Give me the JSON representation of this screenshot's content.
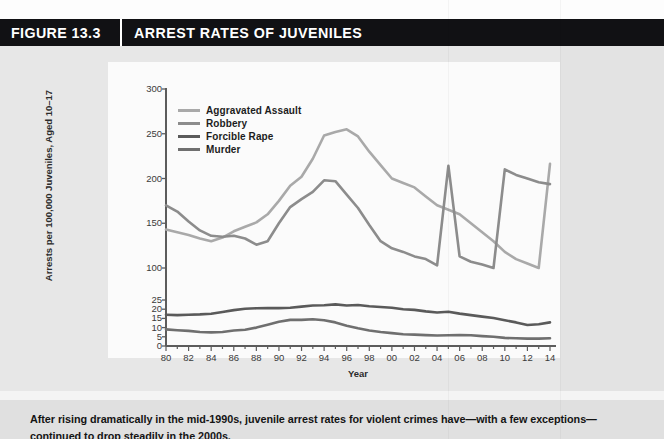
{
  "figure": {
    "number": "FIGURE 13.3",
    "title": "ARREST RATES OF JUVENILES"
  },
  "caption": {
    "line1": "After rising dramatically in the mid-1990s, juvenile arrest rates for violent crimes have—with a few exceptions—",
    "line2": "continued to drop steadily in the 2000s."
  },
  "colors": {
    "header_bg": "#111114",
    "header_text": "#ffffff",
    "body_bg": "#e7e7e7",
    "panel_bg": "#fbfbfb",
    "aggravated_assault": "#a9a9a9",
    "robbery": "#8c8c8c",
    "forcible_rape": "#5a5a5a",
    "murder": "#6f6f6f",
    "axis": "#5c5c5c"
  },
  "chart_data": {
    "type": "line",
    "title": "ARREST RATES OF JUVENILES",
    "xlabel": "Year",
    "ylabel": "Arrests per 100,000 Juveniles, Aged 10–17",
    "grid": false,
    "legend_position": "top-left",
    "axis_note": "Broken y-axis: lower segment 0-25 compressed, upper segment 100-300 linear",
    "x_tick_labels": [
      "80",
      "82",
      "84",
      "86",
      "88",
      "90",
      "92",
      "94",
      "96",
      "98",
      "00",
      "02",
      "04",
      "06",
      "08",
      "10",
      "12",
      "14"
    ],
    "x": [
      1980,
      1981,
      1982,
      1983,
      1984,
      1985,
      1986,
      1987,
      1988,
      1989,
      1990,
      1991,
      1992,
      1993,
      1994,
      1995,
      1996,
      1997,
      1998,
      1999,
      2000,
      2001,
      2002,
      2003,
      2004,
      2005,
      2006,
      2007,
      2008,
      2009,
      2010,
      2011,
      2012,
      2013,
      2014
    ],
    "y_ticks_upper": [
      100,
      150,
      200,
      250,
      300
    ],
    "y_ticks_lower": [
      0,
      5,
      10,
      15,
      20,
      25
    ],
    "ylim_upper": [
      100,
      300
    ],
    "ylim_lower": [
      0,
      25
    ],
    "series": [
      {
        "name": "Aggravated Assault",
        "color": "#a9a9a9",
        "values": [
          143,
          140,
          137,
          133,
          130,
          134,
          141,
          146,
          151,
          160,
          175,
          192,
          202,
          222,
          248,
          252,
          255,
          247,
          230,
          215,
          200,
          195,
          190,
          180,
          170,
          165,
          160,
          150,
          140,
          130,
          118,
          110,
          105,
          100,
          99
        ]
      },
      {
        "name": "Robbery",
        "color": "#8c8c8c",
        "values": [
          170,
          163,
          152,
          142,
          136,
          135,
          136,
          133,
          126,
          130,
          150,
          168,
          177,
          185,
          198,
          197,
          182,
          167,
          148,
          130,
          122,
          118,
          113,
          110,
          103,
          98,
          113,
          107,
          104,
          100,
          96,
          93,
          91,
          89,
          88
        ]
      },
      {
        "name": "Forcible Rape",
        "color": "#5a5a5a",
        "values": [
          17.0,
          16.8,
          17.0,
          17.2,
          17.5,
          18.5,
          19.5,
          20.2,
          20.5,
          20.6,
          20.6,
          20.8,
          21.4,
          22.0,
          22.2,
          22.6,
          22.0,
          22.3,
          21.6,
          21.2,
          20.8,
          20.0,
          19.6,
          18.8,
          18.2,
          18.6,
          17.6,
          16.8,
          16.0,
          15.2,
          14.0,
          12.8,
          11.4,
          11.8,
          12.8
        ]
      },
      {
        "name": "Murder",
        "color": "#6f6f6f",
        "values": [
          9.0,
          8.6,
          8.2,
          7.6,
          7.4,
          7.6,
          8.4,
          8.8,
          10.0,
          11.6,
          13.2,
          14.2,
          14.2,
          14.5,
          14.0,
          12.8,
          11.0,
          9.6,
          8.4,
          7.6,
          7.0,
          6.4,
          6.2,
          5.9,
          5.7,
          5.8,
          6.0,
          5.8,
          5.4,
          5.0,
          4.4,
          4.2,
          4.0,
          4.0,
          4.2
        ]
      }
    ]
  }
}
